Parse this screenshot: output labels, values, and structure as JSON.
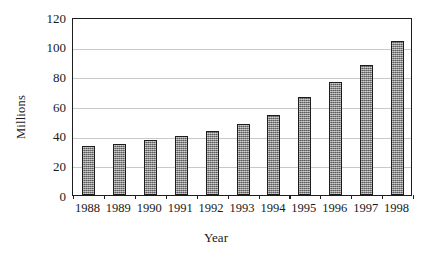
{
  "chart_data": {
    "type": "bar",
    "title": "",
    "xlabel": "Year",
    "ylabel": "Millions",
    "categories": [
      "1988",
      "1989",
      "1990",
      "1991",
      "1992",
      "1993",
      "1994",
      "1995",
      "1996",
      "1997",
      "1998"
    ],
    "values": [
      33,
      34.5,
      37,
      40,
      43.5,
      48,
      54,
      66,
      76.5,
      88,
      104
    ],
    "ylim": [
      0,
      120
    ],
    "ytick_labels": [
      "120",
      "100",
      "80",
      "60",
      "40",
      "20",
      "0"
    ],
    "ytick_values": [
      120,
      100,
      80,
      60,
      40,
      20,
      0
    ],
    "ytick_step": 20,
    "grid": true,
    "legend": "none",
    "series": [
      {
        "name": "Millions",
        "values": [
          33,
          34.5,
          37,
          40,
          43.5,
          48,
          54,
          66,
          76.5,
          88,
          104
        ]
      }
    ],
    "colors": {
      "bar_fill": "#8e8e8e",
      "bar_border": "#1d1d1d",
      "gridline": "#c9c9c9",
      "axis": "#1d1d1d",
      "background": "#ffffff"
    }
  }
}
